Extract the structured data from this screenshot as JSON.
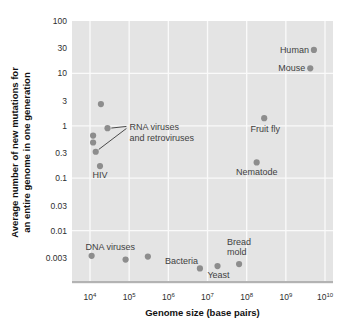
{
  "colors": {
    "background": "#ffffff",
    "plot_background": "#e4e4e4",
    "gridline": "#fafafa",
    "axis_edge": "#b3b3b3",
    "dot": "#8d8d8d",
    "point_label": "#414141",
    "tick_label": "#2e2e2e",
    "axis_title": "#111111",
    "annotation_line": "#4a4a4a"
  },
  "chart_data": {
    "type": "scatter",
    "title": "",
    "xlabel": "Genome size (base pairs)",
    "ylabel": "Average number of new mutations for an entire genome in one generation",
    "ylabel_lines": [
      "Average number of new mutations for",
      "an entire genome in one generation"
    ],
    "grid": "on",
    "x_axis": {
      "scale": "log",
      "range": [
        3500,
        16000000000
      ],
      "ticks": [
        10000,
        100000,
        1000000,
        10000000,
        100000000,
        1000000000,
        10000000000
      ],
      "tick_labels": [
        "10⁴",
        "10⁵",
        "10⁶",
        "10⁷",
        "10⁸",
        "10⁹",
        "10¹⁰"
      ]
    },
    "y_axis": {
      "scale": "log",
      "range": [
        0.001,
        100
      ],
      "ticks": [
        100,
        30,
        10,
        3,
        1,
        0.3,
        0.1,
        0.03,
        0.01,
        0.003
      ],
      "tick_labels": [
        "100",
        "30",
        "10",
        "3",
        "1",
        "0.3",
        "0.1",
        "0.03",
        "0.01",
        "0.003"
      ],
      "gridline_values": [
        10,
        1,
        0.1,
        0.01
      ]
    },
    "points": [
      {
        "name": "rna-virus-1",
        "label": null,
        "x": 19000,
        "y": 2.6
      },
      {
        "name": "rna-virus-2",
        "label": null,
        "x": 28000,
        "y": 0.9
      },
      {
        "name": "rna-virus-3",
        "label": null,
        "x": 12000,
        "y": 0.65
      },
      {
        "name": "rna-virus-4",
        "label": null,
        "x": 12000,
        "y": 0.48
      },
      {
        "name": "rna-virus-5",
        "label": null,
        "x": 14000,
        "y": 0.32
      },
      {
        "name": "hiv",
        "label": "HIV",
        "x": 18000,
        "y": 0.17,
        "label_anchor": "middle",
        "label_dx": 0,
        "label_dy": 12
      },
      {
        "name": "dna-virus-1",
        "label": "DNA viruses",
        "x": 11000,
        "y": 0.0033,
        "label_anchor": "start",
        "label_dx": -6,
        "label_dy": -6
      },
      {
        "name": "dna-virus-2",
        "label": null,
        "x": 81000,
        "y": 0.0028
      },
      {
        "name": "dna-virus-3",
        "label": null,
        "x": 300000,
        "y": 0.0032
      },
      {
        "name": "bacteria",
        "label": "Bacteria",
        "x": 6400000,
        "y": 0.0019,
        "label_anchor": "end",
        "label_dx": -2,
        "label_dy": -4
      },
      {
        "name": "yeast",
        "label": "Yeast",
        "x": 18000000,
        "y": 0.0021,
        "label_anchor": "middle",
        "label_dx": 1,
        "label_dy": 12
      },
      {
        "name": "bread-mold",
        "label": "Bread mold",
        "label_lines": [
          "Bread",
          "mold"
        ],
        "x": 64000000,
        "y": 0.0023,
        "label_anchor": "start",
        "label_dx": -12,
        "label_dy": -19,
        "label_line_height": 10
      },
      {
        "name": "nematode",
        "label": "Nematode",
        "x": 180000000,
        "y": 0.2,
        "label_anchor": "middle",
        "label_dx": 0,
        "label_dy": 13
      },
      {
        "name": "fruit-fly",
        "label": "Fruit fly",
        "x": 280000000,
        "y": 1.4,
        "label_anchor": "middle",
        "label_dx": 1,
        "label_dy": 14
      },
      {
        "name": "mouse",
        "label": "Mouse",
        "x": 4200000000,
        "y": 12.5,
        "label_anchor": "end",
        "label_dx": -5,
        "label_dy": 3
      },
      {
        "name": "human",
        "label": "Human",
        "x": 5200000000,
        "y": 28,
        "label_anchor": "end",
        "label_dx": -5,
        "label_dy": 3
      }
    ],
    "annotations": [
      {
        "name": "rna-viruses-annotation",
        "lines": [
          "RNA viruses",
          "and retroviruses"
        ],
        "anchor": {
          "x": 93000,
          "y": 0.93
        },
        "targets": [
          {
            "x": 28000,
            "y": 0.9
          },
          {
            "x": 14000,
            "y": 0.32
          }
        ]
      }
    ]
  }
}
